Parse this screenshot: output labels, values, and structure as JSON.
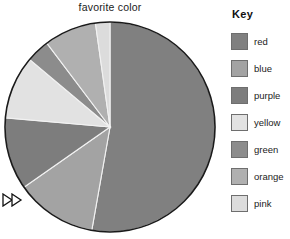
{
  "chart_data": {
    "type": "pie",
    "title": "favorite color",
    "xlabel": "",
    "ylabel": "",
    "legend_position": "right",
    "grid": false,
    "categories": [
      "red",
      "blue",
      "purple",
      "yellow",
      "green",
      "orange",
      "pink"
    ],
    "values": [
      52.8,
      12.5,
      11.1,
      9.7,
      3.6,
      8.1,
      2.2
    ],
    "units": "percent",
    "start_angle_deg": 0,
    "direction": "clockwise",
    "slices": [
      {
        "label": "red",
        "percent": 52.8,
        "angle_deg": 190,
        "start_deg": 0,
        "end_deg": 190,
        "color": "#808080"
      },
      {
        "label": "blue",
        "percent": 12.5,
        "angle_deg": 45,
        "start_deg": 190,
        "end_deg": 235,
        "color": "#a3a3a3"
      },
      {
        "label": "purple",
        "percent": 11.1,
        "angle_deg": 40,
        "start_deg": 235,
        "end_deg": 275,
        "color": "#7d7d7d"
      },
      {
        "label": "yellow",
        "percent": 9.7,
        "angle_deg": 35,
        "start_deg": 275,
        "end_deg": 310,
        "color": "#e2e2e2"
      },
      {
        "label": "green",
        "percent": 3.6,
        "angle_deg": 13,
        "start_deg": 310,
        "end_deg": 323,
        "color": "#8c8c8c"
      },
      {
        "label": "orange",
        "percent": 8.1,
        "angle_deg": 29,
        "start_deg": 323,
        "end_deg": 352,
        "color": "#b0b0b0"
      },
      {
        "label": "pink",
        "percent": 2.2,
        "angle_deg": 8,
        "start_deg": 352,
        "end_deg": 360,
        "color": "#dcdcdc"
      }
    ]
  },
  "legend": {
    "title": "Key",
    "items": [
      {
        "label": "red",
        "color": "#808080"
      },
      {
        "label": "blue",
        "color": "#a3a3a3"
      },
      {
        "label": "purple",
        "color": "#7d7d7d"
      },
      {
        "label": "yellow",
        "color": "#e2e2e2"
      },
      {
        "label": "green",
        "color": "#8c8c8c"
      },
      {
        "label": "orange",
        "color": "#b0b0b0"
      },
      {
        "label": "pink",
        "color": "#dcdcdc"
      }
    ]
  },
  "marker": {
    "icon": "fast-forward-arrow-icon"
  },
  "geometry": {
    "center_x": 110,
    "center_y": 127,
    "radius": 105,
    "outline_color": "#1a1a1a"
  }
}
